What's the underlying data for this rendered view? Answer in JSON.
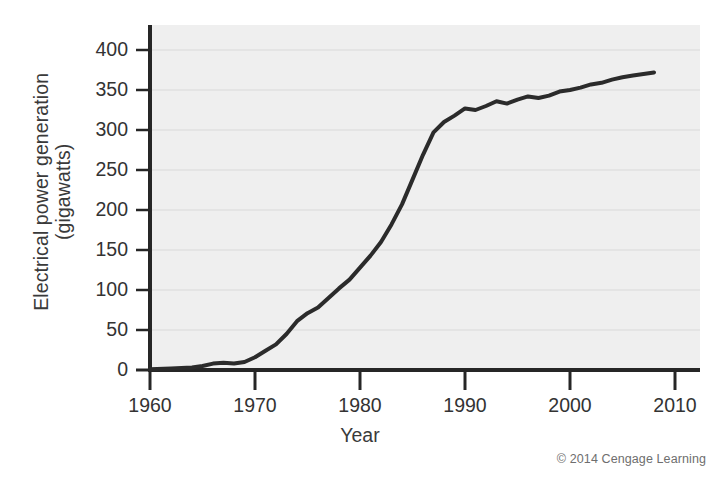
{
  "chart_data": {
    "type": "line",
    "title": "",
    "xlabel": "Year",
    "ylabel": "Electrical power generation (gigawatts)",
    "ylabel_line1": "Electrical power generation",
    "ylabel_line2": "(gigawatts)",
    "xlim": [
      1960,
      2010
    ],
    "ylim": [
      0,
      412
    ],
    "xticks": [
      1960,
      1970,
      1980,
      1990,
      2000,
      2010
    ],
    "xtick_labels": [
      "1960",
      "1970",
      "1980",
      "1990",
      "2000",
      "2010"
    ],
    "yticks": [
      0,
      50,
      100,
      150,
      200,
      250,
      300,
      350,
      400
    ],
    "ytick_labels": [
      "0",
      "50",
      "100",
      "150",
      "200",
      "250",
      "300",
      "350",
      "400"
    ],
    "grid": true,
    "grid_axis": "y",
    "legend": false,
    "line_color": "#2b2b2b",
    "line_width": 4,
    "plot_bg": "#efefef",
    "series": [
      {
        "name": "Nuclear electrical power generation",
        "x": [
          1960,
          1962,
          1964,
          1965,
          1966,
          1967,
          1968,
          1969,
          1970,
          1971,
          1972,
          1973,
          1974,
          1975,
          1976,
          1977,
          1978,
          1979,
          1980,
          1981,
          1982,
          1983,
          1984,
          1985,
          1986,
          1987,
          1988,
          1989,
          1990,
          1991,
          1992,
          1993,
          1994,
          1995,
          1996,
          1997,
          1998,
          1999,
          2000,
          2001,
          2002,
          2003,
          2004,
          2005,
          2006,
          2007,
          2008
        ],
        "y": [
          1,
          2,
          3,
          5,
          8,
          9,
          8,
          10,
          16,
          24,
          32,
          45,
          61,
          71,
          78,
          90,
          102,
          113,
          128,
          143,
          160,
          182,
          207,
          238,
          269,
          297,
          310,
          318,
          327,
          325,
          330,
          336,
          333,
          338,
          342,
          340,
          343,
          348,
          350,
          353,
          357,
          359,
          363,
          366,
          368,
          370,
          372
        ]
      }
    ],
    "source_note": "© 2014 Cengage Learning"
  },
  "figure": {
    "credit": "© 2014 Cengage Learning"
  }
}
